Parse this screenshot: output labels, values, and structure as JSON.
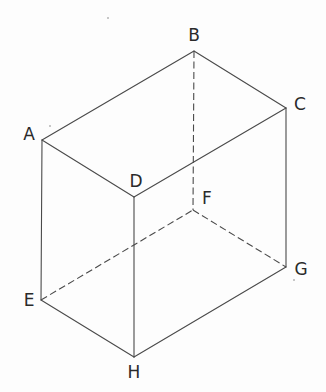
{
  "diagram": {
    "type": "cuboid-perspective",
    "colors": {
      "background": "#fdfdfd",
      "edge": "#4a4a4a",
      "label": "#2a2a2a"
    },
    "vertices": {
      "A": {
        "label": "A",
        "x": 42,
        "y": 140,
        "label_x": 29,
        "label_y": 134
      },
      "B": {
        "label": "B",
        "x": 194,
        "y": 51,
        "label_x": 194,
        "label_y": 35
      },
      "C": {
        "label": "C",
        "x": 286,
        "y": 108,
        "label_x": 300,
        "label_y": 104
      },
      "D": {
        "label": "D",
        "x": 134,
        "y": 197,
        "label_x": 136,
        "label_y": 181
      },
      "E": {
        "label": "E",
        "x": 41,
        "y": 300,
        "label_x": 29,
        "label_y": 300
      },
      "F": {
        "label": "F",
        "x": 193,
        "y": 210,
        "label_x": 207,
        "label_y": 198
      },
      "G": {
        "label": "G",
        "x": 286,
        "y": 267,
        "label_x": 301,
        "label_y": 269
      },
      "H": {
        "label": "H",
        "x": 134,
        "y": 357,
        "label_x": 134,
        "label_y": 372
      }
    },
    "edges": {
      "solid": [
        [
          "A",
          "B"
        ],
        [
          "B",
          "C"
        ],
        [
          "C",
          "D"
        ],
        [
          "D",
          "A"
        ],
        [
          "A",
          "E"
        ],
        [
          "D",
          "H"
        ],
        [
          "C",
          "G"
        ],
        [
          "E",
          "H"
        ],
        [
          "H",
          "G"
        ]
      ],
      "hidden": [
        [
          "B",
          "F"
        ],
        [
          "E",
          "F"
        ],
        [
          "F",
          "G"
        ]
      ]
    }
  }
}
